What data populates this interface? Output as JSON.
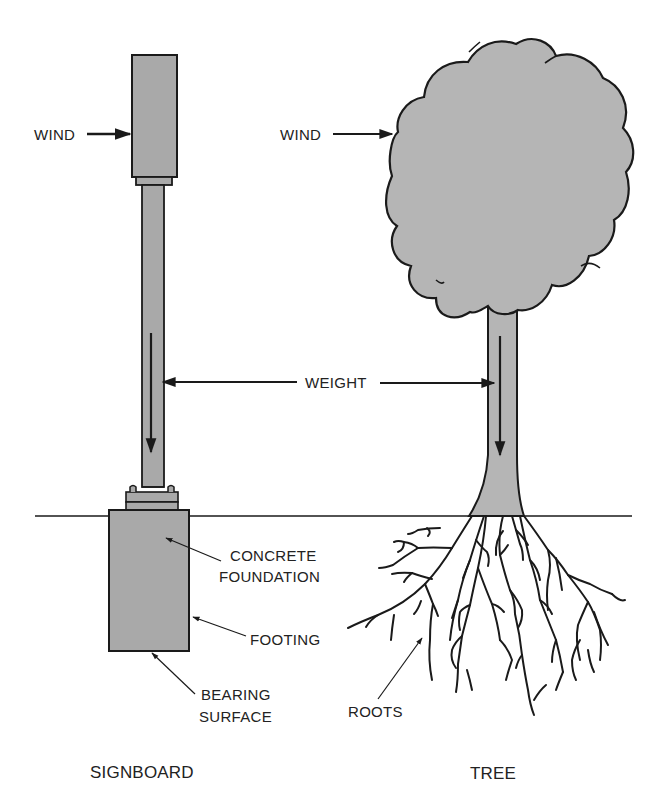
{
  "diagram": {
    "colors": {
      "fill": "#a9a9a9",
      "tree_fill": "#b5b5b5",
      "stroke": "#1a1a1a",
      "background": "#ffffff"
    },
    "signboard": {
      "caption": "SIGNBOARD",
      "wind_label": "WIND",
      "labels": {
        "concrete_foundation_line1": "CONCRETE",
        "concrete_foundation_line2": "FOUNDATION",
        "footing": "FOOTING",
        "bearing_surface_line1": "BEARING",
        "bearing_surface_line2": "SURFACE"
      }
    },
    "tree": {
      "caption": "TREE",
      "wind_label": "WIND",
      "roots_label": "ROOTS"
    },
    "shared": {
      "weight_label": "WEIGHT"
    }
  }
}
